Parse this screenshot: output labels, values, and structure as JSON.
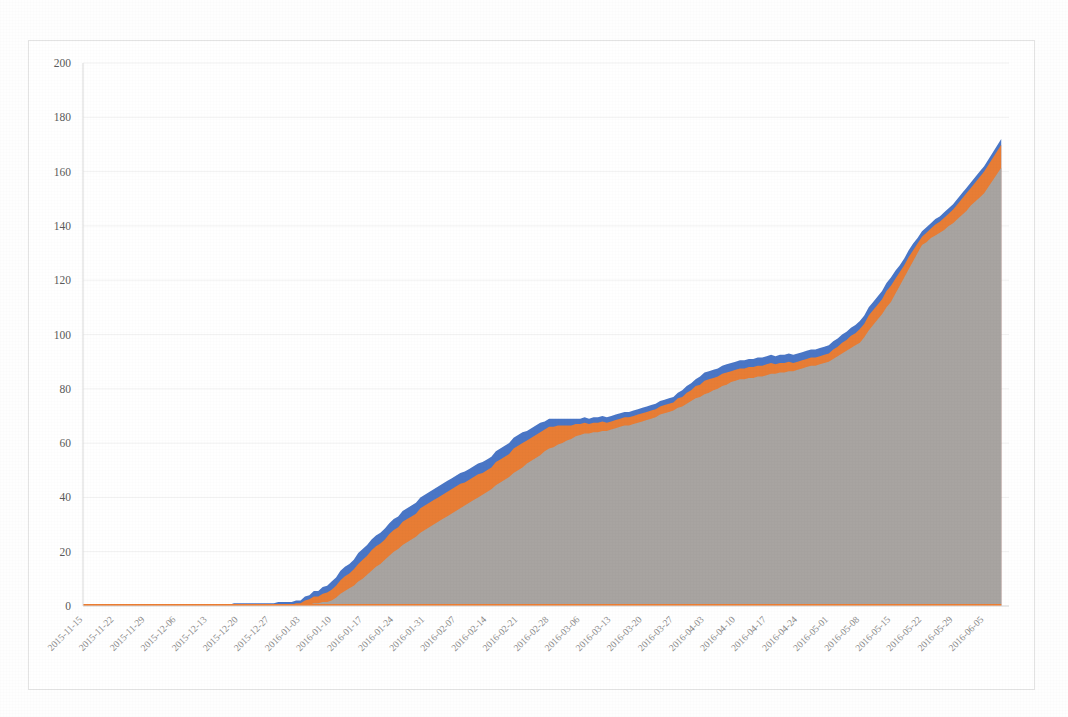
{
  "chart_data": {
    "type": "area",
    "stacked": true,
    "title": "",
    "xlabel": "",
    "ylabel": "",
    "ylim": [
      0,
      200
    ],
    "ytick_step": 20,
    "yticks": [
      0,
      20,
      40,
      60,
      80,
      100,
      120,
      140,
      160,
      180,
      200
    ],
    "grid": true,
    "legend_position": "none",
    "x_tick_interval_days": 7,
    "categories": [
      "2015-11-15",
      "2015-11-22",
      "2015-11-29",
      "2015-12-06",
      "2015-12-13",
      "2015-12-20",
      "2015-12-27",
      "2016-01-03",
      "2016-01-10",
      "2016-01-17",
      "2016-01-24",
      "2016-01-31",
      "2016-02-07",
      "2016-02-14",
      "2016-02-21",
      "2016-02-28",
      "2016-03-06",
      "2016-03-13",
      "2016-03-20",
      "2016-03-27",
      "2016-04-03",
      "2016-04-10",
      "2016-04-17",
      "2016-04-24",
      "2016-05-01",
      "2016-05-08",
      "2016-05-15",
      "2016-05-22",
      "2016-05-29",
      "2016-06-05"
    ],
    "series": [
      {
        "name": "series-bottom-gray",
        "color": "#A5A5A5",
        "stack_order": 1,
        "values": [
          0,
          0,
          0,
          0,
          0,
          0,
          0,
          0,
          2,
          10,
          20,
          28,
          35,
          42,
          50,
          58,
          63,
          65,
          68,
          72,
          78,
          83,
          85,
          87,
          90,
          97,
          112,
          133,
          141,
          152
        ]
      },
      {
        "name": "series-middle-orange",
        "color": "#ED7D31",
        "stack_order": 2,
        "values": [
          0,
          0,
          0,
          0,
          0,
          0,
          0,
          1,
          4,
          7,
          8,
          9,
          9,
          8,
          9,
          8,
          4,
          3,
          3,
          3,
          5,
          4,
          4,
          3,
          3,
          5,
          6,
          3,
          5,
          8
        ]
      },
      {
        "name": "series-top-blue",
        "color": "#4472C4",
        "stack_order": 3,
        "values": [
          0,
          0,
          0,
          0,
          0,
          1,
          1,
          1,
          3,
          4,
          4,
          4,
          4,
          4,
          4,
          3,
          2,
          2,
          2,
          2,
          3,
          3,
          3,
          3,
          3,
          3,
          3,
          2,
          2,
          2
        ]
      }
    ],
    "totals": [
      0,
      0,
      0,
      0,
      0,
      1,
      1,
      2,
      9,
      21,
      32,
      41,
      48,
      54,
      63,
      69,
      69,
      70,
      73,
      77,
      86,
      90,
      92,
      93,
      96,
      105,
      121,
      138,
      148,
      162
    ],
    "peak_value": 172,
    "peak_label": "2016-06-10"
  }
}
